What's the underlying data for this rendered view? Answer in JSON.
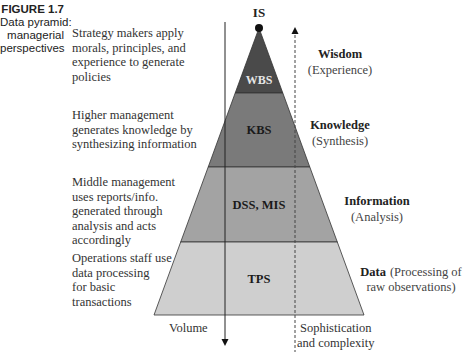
{
  "figure": {
    "number": "FIGURE 1.7",
    "caption_lines": [
      "Data pyramid:",
      "managerial",
      "perspectives"
    ]
  },
  "apex_label": "IS",
  "levels": [
    {
      "id": "wbs",
      "system": "WBS",
      "title": "Wisdom",
      "subtitle": "(Experience)",
      "description": [
        "Strategy makers apply",
        "morals, principles, and",
        "experience to generate",
        "policies"
      ],
      "fill": "#4a4a4a",
      "text_color": "#e6e6e6"
    },
    {
      "id": "kbs",
      "system": "KBS",
      "title": "Knowledge",
      "subtitle": "(Synthesis)",
      "description": [
        "Higher management",
        "generates knowledge by",
        "synthesizing information"
      ],
      "fill": "#7a7a7a",
      "text_color": "#1a1a1a"
    },
    {
      "id": "dss",
      "system": "DSS, MIS",
      "title": "Information",
      "subtitle": "(Analysis)",
      "description": [
        "Middle management",
        "uses reports/info.",
        "generated through",
        "analysis and acts",
        "accordingly"
      ],
      "fill": "#a3a3a3",
      "text_color": "#1a1a1a"
    },
    {
      "id": "tps",
      "system": "TPS",
      "title": "Data",
      "subtitle": "(Processing of",
      "subtitle2": "raw observations)",
      "description": [
        "Operations staff use",
        "data processing",
        "for basic",
        "transactions"
      ],
      "fill": "#cfcfcf",
      "text_color": "#1a1a1a"
    }
  ],
  "axes": {
    "volume_label": "Volume",
    "sophistication_label": [
      "Sophistication",
      "and complexity"
    ]
  }
}
